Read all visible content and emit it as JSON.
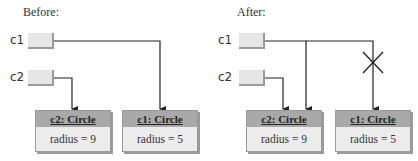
{
  "before": {
    "title": "Before:",
    "variables": [
      {
        "name": "c1"
      },
      {
        "name": "c2"
      }
    ],
    "objects": [
      {
        "header": "c2: Circle",
        "field": "radius = 9"
      },
      {
        "header": "c1: Circle",
        "field": "radius = 5"
      }
    ]
  },
  "after": {
    "title": "After:",
    "variables": [
      {
        "name": "c1"
      },
      {
        "name": "c2"
      }
    ],
    "objects": [
      {
        "header": "c2: Circle",
        "field": "radius = 9"
      },
      {
        "header": "c1: Circle",
        "field": "radius = 5"
      }
    ],
    "removed_reference_marker": "X"
  },
  "colors": {
    "line": "#222222",
    "ref_box": "#e6e6e6",
    "obj_header": "#a9a9a9",
    "obj_body": "#ececec"
  }
}
